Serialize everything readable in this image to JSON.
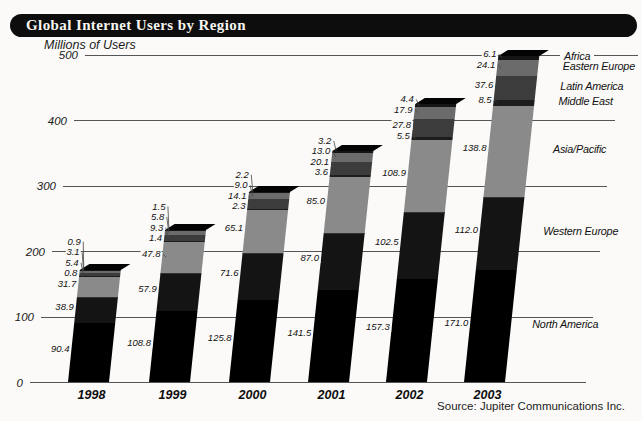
{
  "title": "Global Internet Users by Region",
  "y_axis_title": "Millions of Users",
  "source": "Source: Jupiter Communications Inc.",
  "chart_data": {
    "type": "bar",
    "stacked": true,
    "title": "Global Internet Users by Region",
    "ylabel": "Millions of Users",
    "ylim": [
      0,
      500
    ],
    "yticks": [
      0,
      100,
      200,
      300,
      400,
      500
    ],
    "grid": "horizontal",
    "legend_position": "right",
    "categories": [
      "1998",
      "1999",
      "2000",
      "2001",
      "2002",
      "2003"
    ],
    "series": [
      {
        "name": "North America",
        "color": "#000000",
        "values": [
          90.4,
          108.8,
          125.8,
          141.5,
          157.3,
          171.0
        ]
      },
      {
        "name": "Western Europe",
        "color": "#141414",
        "values": [
          38.9,
          57.9,
          71.6,
          87.0,
          102.5,
          112.0
        ]
      },
      {
        "name": "Asia/Pacific",
        "color": "#8a8a8a",
        "values": [
          31.7,
          47.8,
          65.1,
          85.0,
          108.9,
          138.8
        ]
      },
      {
        "name": "Middle East",
        "color": "#1d1d1d",
        "values": [
          0.8,
          1.4,
          2.3,
          3.6,
          5.5,
          8.5
        ]
      },
      {
        "name": "Latin America",
        "color": "#3c3c3c",
        "values": [
          5.4,
          9.3,
          14.1,
          20.1,
          27.8,
          37.6
        ]
      },
      {
        "name": "Eastern Europe",
        "color": "#6b6b6b",
        "values": [
          3.1,
          5.8,
          9.0,
          13.0,
          17.9,
          24.1
        ]
      },
      {
        "name": "Africa",
        "color": "#151515",
        "values": [
          0.9,
          1.5,
          2.2,
          3.2,
          4.4,
          6.1
        ]
      }
    ],
    "legend_order_top_to_bottom": [
      "Africa",
      "Eastern Europe",
      "Latin America",
      "Middle East",
      "Asia/Pacific",
      "Western Europe",
      "North America"
    ]
  }
}
